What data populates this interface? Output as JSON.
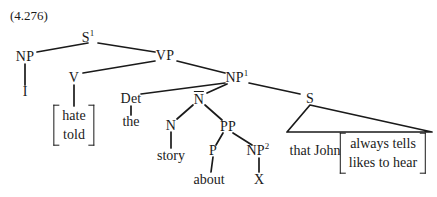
{
  "figure": {
    "example_number": "(4.276)",
    "type": "syntax-tree"
  },
  "nodes": {
    "s1": {
      "label": "S",
      "superscript": "1",
      "x": 88,
      "y": 38
    },
    "np_subject": {
      "label": "NP",
      "x": 25,
      "y": 57
    },
    "vp": {
      "label": "VP",
      "x": 165,
      "y": 56
    },
    "v": {
      "label": "V",
      "x": 74,
      "y": 78
    },
    "np1": {
      "label": "NP",
      "superscript": "1",
      "x": 237,
      "y": 78
    },
    "det": {
      "label": "Det",
      "x": 131,
      "y": 99
    },
    "nbar": {
      "label": "N",
      "overline": true,
      "x": 199,
      "y": 99
    },
    "s_rel": {
      "label": "S",
      "x": 310,
      "y": 99
    },
    "n": {
      "label": "N",
      "x": 171,
      "y": 126
    },
    "pp": {
      "label": "PP",
      "x": 228,
      "y": 127
    },
    "p": {
      "label": "P",
      "x": 213,
      "y": 151
    },
    "np2": {
      "label": "NP",
      "superscript": "2",
      "x": 258,
      "y": 151
    }
  },
  "terminals": {
    "i": {
      "text": "I",
      "x": 25,
      "y": 92
    },
    "the": {
      "text": "the",
      "x": 131,
      "y": 122
    },
    "story": {
      "text": "story",
      "x": 171,
      "y": 156
    },
    "about": {
      "text": "about",
      "x": 209,
      "y": 180
    },
    "x": {
      "text": "X",
      "x": 259,
      "y": 180
    },
    "that_john": {
      "text": "that John",
      "x": 315,
      "y": 151
    }
  },
  "brace_sets": {
    "verb_alternation": {
      "alternatives": [
        "hate",
        "told"
      ],
      "x": 74,
      "y": 125
    },
    "relative_alternation": {
      "alternatives": [
        "always tells",
        "likes to hear"
      ],
      "x": 383,
      "y": 153
    }
  },
  "edges": [
    {
      "name": "s1-np",
      "x1": 88,
      "y1": 43,
      "x2": 37,
      "y2": 52
    },
    {
      "name": "s1-vp",
      "x1": 98,
      "y1": 43,
      "x2": 155,
      "y2": 52
    },
    {
      "name": "np-i",
      "x1": 25,
      "y1": 64,
      "x2": 25,
      "y2": 85
    },
    {
      "name": "vp-v",
      "x1": 155,
      "y1": 61,
      "x2": 83,
      "y2": 73
    },
    {
      "name": "vp-np1",
      "x1": 177,
      "y1": 61,
      "x2": 225,
      "y2": 73
    },
    {
      "name": "v-brace",
      "x1": 74,
      "y1": 85,
      "x2": 74,
      "y2": 106
    },
    {
      "name": "np1-det",
      "x1": 225,
      "y1": 83,
      "x2": 141,
      "y2": 94
    },
    {
      "name": "np1-nbar",
      "x1": 227,
      "y1": 84,
      "x2": 207,
      "y2": 93
    },
    {
      "name": "np1-s",
      "x1": 249,
      "y1": 83,
      "x2": 300,
      "y2": 94
    },
    {
      "name": "det-the",
      "x1": 131,
      "y1": 106,
      "x2": 131,
      "y2": 115
    },
    {
      "name": "nbar-n",
      "x1": 193,
      "y1": 105,
      "x2": 177,
      "y2": 119
    },
    {
      "name": "nbar-pp",
      "x1": 205,
      "y1": 105,
      "x2": 222,
      "y2": 120
    },
    {
      "name": "n-story",
      "x1": 171,
      "y1": 132,
      "x2": 171,
      "y2": 148
    },
    {
      "name": "pp-p",
      "x1": 223,
      "y1": 133,
      "x2": 216,
      "y2": 145
    },
    {
      "name": "pp-np2",
      "x1": 233,
      "y1": 133,
      "x2": 252,
      "y2": 145
    },
    {
      "name": "p-about",
      "x1": 213,
      "y1": 157,
      "x2": 211,
      "y2": 172
    },
    {
      "name": "np2-x",
      "x1": 259,
      "y1": 158,
      "x2": 259,
      "y2": 172
    }
  ],
  "triangle": {
    "name": "abbreviated-subtree",
    "apex_x": 310,
    "apex_y": 105,
    "base_left_x": 287,
    "base_left_y": 132,
    "base_right_x": 432,
    "base_right_y": 132
  },
  "colors": {
    "ink": "#1a1a1a",
    "background": "#ffffff"
  }
}
